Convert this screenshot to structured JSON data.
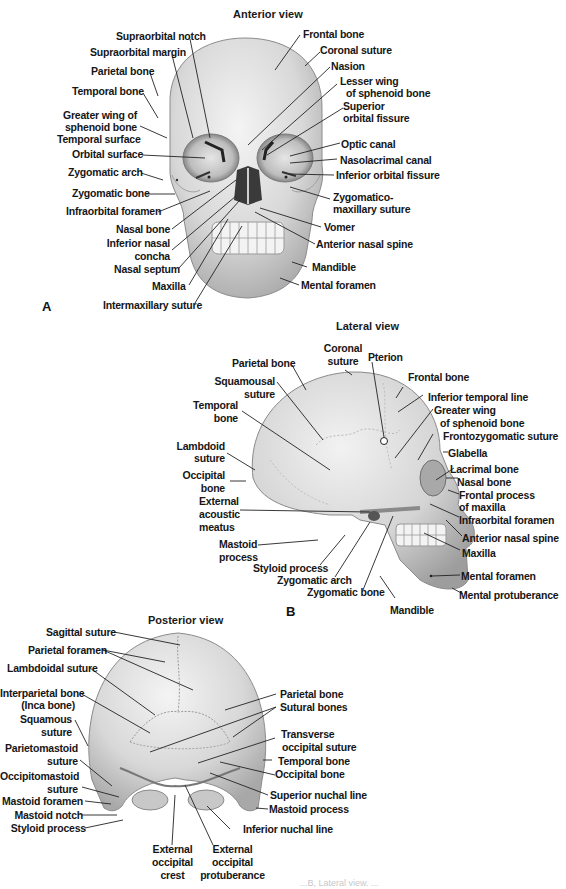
{
  "figure": {
    "panels": [
      {
        "letter": "A",
        "title": "Anterior view",
        "labels_left": [
          "Supraorbital notch",
          "Supraorbital margin",
          "Parietal bone",
          "Temporal bone",
          "Greater wing of",
          "sphenoid bone",
          "Temporal surface",
          "Orbital surface",
          "Zygomatic arch",
          "Zygomatic bone",
          "Infraorbital foramen",
          "Nasal bone",
          "Inferior nasal",
          "concha",
          "Nasal septum",
          "Maxilla",
          "Intermaxillary suture"
        ],
        "labels_right": [
          "Frontal bone",
          "Coronal suture",
          "Nasion",
          "Lesser wing",
          "of sphenoid bone",
          "Superior",
          "orbital fissure",
          "Optic canal",
          "Nasolacrimal canal",
          "Inferior orbital fissure",
          "Zygomatico-",
          "maxillary suture",
          "Vomer",
          "Anterior nasal spine",
          "Mandible",
          "Mental foramen"
        ]
      },
      {
        "letter": "B",
        "title": "Lateral view",
        "labels_left": [
          "Parietal bone",
          "Squamousal",
          "suture",
          "Temporal",
          "bone",
          "Lambdoid",
          "suture",
          "Occipital",
          "bone",
          "External",
          "acoustic",
          "meatus",
          "Mastoid",
          "process",
          "Styloid process",
          "Zygomatic arch",
          "Zygomatic bone"
        ],
        "labels_top": [
          "Coronal",
          "suture",
          "Pterion"
        ],
        "labels_right": [
          "Frontal bone",
          "Inferior temporal line",
          "Greater wing",
          "of sphenoid bone",
          "Frontozygomatic suture",
          "Glabella",
          "Lacrimal bone",
          "Nasal bone",
          "Frontal process",
          "of maxilla",
          "Infraorbital foramen",
          "Anterior nasal spine",
          "Maxilla",
          "Mental foramen",
          "Mental protuberance"
        ],
        "labels_bottom": [
          "Mandible"
        ]
      },
      {
        "title": "Posterior view",
        "labels_left": [
          "Sagittal suture",
          "Parietal foramen",
          "Lambdoidal suture",
          "Interparietal bone",
          "(Inca bone)",
          "Squamous",
          "suture",
          "Parietomastoid",
          "suture",
          "Occipitomastoid",
          "suture",
          "Mastoid foramen",
          "Mastoid notch",
          "Styloid process"
        ],
        "labels_right": [
          "Parietal bone",
          "Sutural bones",
          "Transverse",
          "occipital suture",
          "Temporal bone",
          "Occipital bone",
          "Superior nuchal line",
          "Mastoid process",
          "Inferior nuchal line"
        ],
        "labels_bottom": [
          "External",
          "occipital",
          "crest",
          "External",
          "occipital",
          "protuberance"
        ]
      }
    ],
    "caption_fragment": "...B, Lateral view. ..."
  },
  "colors": {
    "bone_light": "#ececec",
    "bone_mid": "#cfcfcf",
    "bone_dark": "#9a9a9a",
    "leader_line": "#222222",
    "text": "#161616"
  }
}
